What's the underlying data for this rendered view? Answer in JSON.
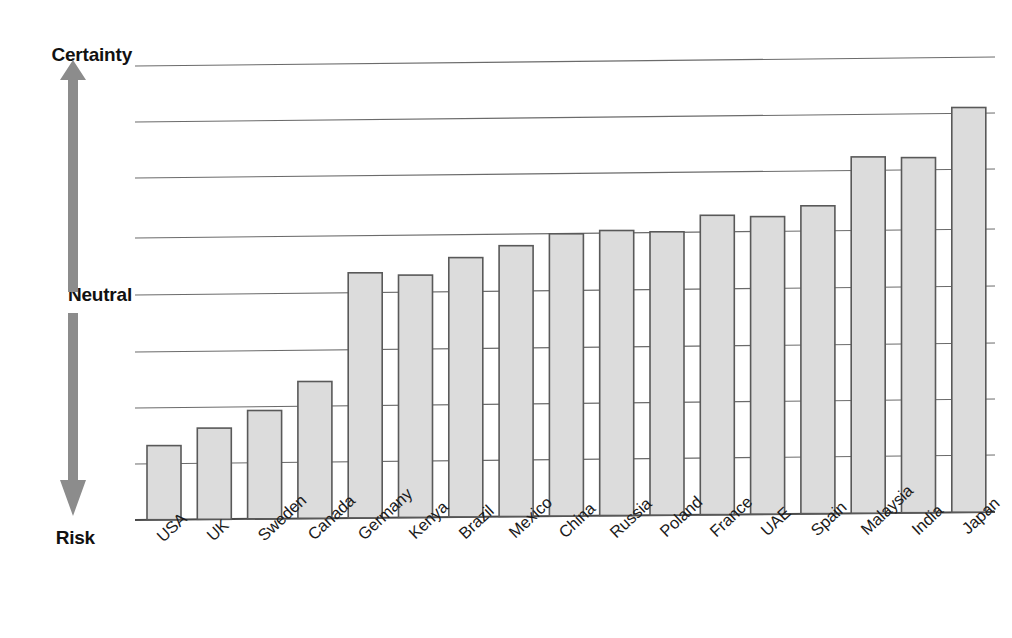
{
  "chart_data": {
    "type": "bar",
    "title": "",
    "subtitle": "",
    "xlabel": "",
    "ylabel": "",
    "categories": [
      "USA",
      "UK",
      "Sweden",
      "Canada",
      "Germany",
      "Kenya",
      "Brazil",
      "Mexico",
      "China",
      "Russia",
      "Poland",
      "France",
      "UAE",
      "Spain",
      "Malaysia",
      "India",
      "Japan"
    ],
    "values": [
      1.3,
      1.6,
      1.9,
      2.4,
      4.3,
      4.25,
      4.55,
      4.75,
      4.95,
      5.0,
      4.97,
      5.25,
      5.22,
      5.4,
      6.25,
      6.23,
      7.1
    ],
    "ylim": [
      0,
      8
    ],
    "grid": true,
    "gridline_count": 8,
    "legend": "none",
    "axis_scale_labels": {
      "top": "Certainty",
      "middle": "Neutral",
      "bottom": "Risk"
    },
    "axis_scale_positions": {
      "top": 8,
      "middle": 4,
      "bottom": 0
    },
    "colors": {
      "bar_fill": "#dcdcdc",
      "bar_stroke": "#595959",
      "gridline": "#6b6b6b",
      "baseline": "#4a4a4a",
      "arrow": "#8c8c8c",
      "text": "#111111",
      "background": "#ffffff"
    }
  },
  "axis": {
    "certainty_label": "Certainty",
    "neutral_label": "Neutral",
    "risk_label": "Risk"
  },
  "icons": {
    "arrow": "double-headed-vertical-arrow"
  }
}
